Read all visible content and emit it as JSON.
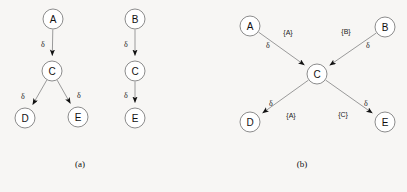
{
  "figure": {
    "background_color": "#f7f6f4",
    "node_fill": "#ffffff",
    "node_stroke": "#8c8c8c",
    "edge_color": "#9a9a9a",
    "arrow_color": "#111111",
    "text_color": "#111111"
  },
  "chart_data": {
    "type": "diagram",
    "title": "",
    "panels": [
      {
        "id": "a",
        "caption": "(a)",
        "nodes": [
          {
            "id": "a-A",
            "label": "A",
            "x": 53,
            "y": 19
          },
          {
            "id": "a-C1",
            "label": "C",
            "x": 52,
            "y": 71
          },
          {
            "id": "a-D",
            "label": "D",
            "x": 25,
            "y": 118
          },
          {
            "id": "a-E1",
            "label": "E",
            "x": 78,
            "y": 117
          },
          {
            "id": "a-B",
            "label": "B",
            "x": 135,
            "y": 19
          },
          {
            "id": "a-C2",
            "label": "C",
            "x": 135,
            "y": 71
          },
          {
            "id": "a-E2",
            "label": "E",
            "x": 135,
            "y": 118
          }
        ],
        "edges": [
          {
            "from": "a-A",
            "to": "a-C1",
            "delta": "δ",
            "delta_x": 43,
            "delta_y": 44
          },
          {
            "from": "a-C1",
            "to": "a-D",
            "delta": "δ",
            "delta_x": 23,
            "delta_y": 96
          },
          {
            "from": "a-C1",
            "to": "a-E1",
            "delta": "δ",
            "delta_x": 79,
            "delta_y": 95
          },
          {
            "from": "a-B",
            "to": "a-C2",
            "delta": "δ",
            "delta_x": 126,
            "delta_y": 44
          },
          {
            "from": "a-C2",
            "to": "a-E2",
            "delta": "δ",
            "delta_x": 126,
            "delta_y": 95
          }
        ]
      },
      {
        "id": "b",
        "caption": "(b)",
        "nodes": [
          {
            "id": "b-A",
            "label": "A",
            "x": 250,
            "y": 26
          },
          {
            "id": "b-B",
            "label": "B",
            "x": 385,
            "y": 27
          },
          {
            "id": "b-C",
            "label": "C",
            "x": 317,
            "y": 74
          },
          {
            "id": "b-D",
            "label": "D",
            "x": 250,
            "y": 122
          },
          {
            "id": "b-E",
            "label": "E",
            "x": 385,
            "y": 122
          }
        ],
        "edges": [
          {
            "from": "b-A",
            "to": "b-C",
            "delta": "δ",
            "delta_x": 268,
            "delta_y": 45,
            "set": "{A}",
            "set_x": 288,
            "set_y": 32
          },
          {
            "from": "b-B",
            "to": "b-C",
            "delta": "δ",
            "delta_x": 368,
            "delta_y": 45,
            "set": "{B}",
            "set_x": 346,
            "set_y": 31
          },
          {
            "from": "b-C",
            "to": "b-D",
            "delta": "δ",
            "delta_x": 271,
            "delta_y": 103,
            "set": "{A}",
            "set_x": 291,
            "set_y": 115
          },
          {
            "from": "b-C",
            "to": "b-E",
            "delta": "δ",
            "delta_x": 366,
            "delta_y": 103,
            "set": "{C}",
            "set_x": 343,
            "set_y": 114
          }
        ]
      }
    ],
    "node_radius": 10,
    "legend": []
  }
}
